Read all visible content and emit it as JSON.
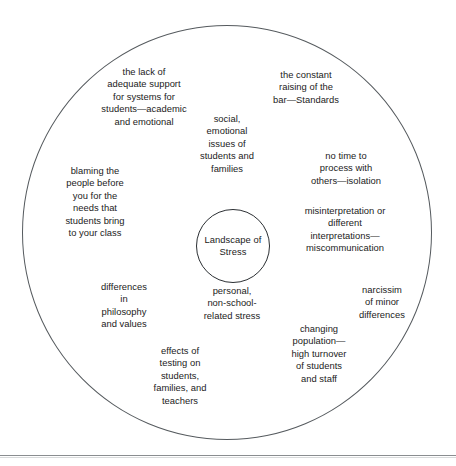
{
  "diagram": {
    "type": "concentric-circle-cluster",
    "core": {
      "label": "Landscape\nof Stress"
    },
    "stressors": [
      {
        "id": "lack-of-support",
        "text": "the lack of\nadequate support\nfor systems for\nstudents—academic\nand emotional"
      },
      {
        "id": "raising-the-bar",
        "text": "the constant\nraising of the\nbar—Standards"
      },
      {
        "id": "social-emotional",
        "text": "social,\nemotional\nissues of\nstudents and\nfamilies"
      },
      {
        "id": "no-time",
        "text": "no time to\nprocess with\nothers—isolation"
      },
      {
        "id": "blaming",
        "text": "blaming the\npeople before\nyou for the\nneeds that\nstudents bring\nto your class"
      },
      {
        "id": "misinterpretation",
        "text": "misinterpretation or\ndifferent\ninterpretations—\nmiscommunication"
      },
      {
        "id": "differences-philosophy",
        "text": "differences\nin\nphilosophy\nand values"
      },
      {
        "id": "personal-stress",
        "text": "personal,\nnon-school-\nrelated stress"
      },
      {
        "id": "narcissim",
        "text": "narcissim\nof minor\ndifferences"
      },
      {
        "id": "changing-population",
        "text": "changing\npopulation—\nhigh turnover\nof students\nand staff"
      },
      {
        "id": "effects-of-testing",
        "text": "effects of\ntesting on\nstudents,\nfamilies, and\nteachers"
      }
    ]
  },
  "colors": {
    "outer_circle_stroke": "#555a5e",
    "inner_circle_stroke": "#2b2f33",
    "text": "#1b1b1b",
    "rule": "#8a8d90",
    "background": "#ffffff"
  }
}
